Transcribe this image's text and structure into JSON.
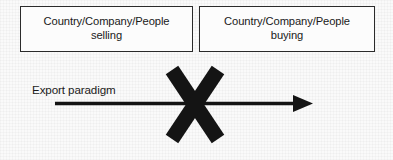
{
  "diagram": {
    "background_color": "#fafafa",
    "line_color": "#141414",
    "border_color": "#2b2b2b",
    "nodes": [
      {
        "id": "seller",
        "label": "Country/Company/People\nselling",
        "line1": "Country/Company/People",
        "line2": "selling"
      },
      {
        "id": "buyer",
        "label": "Country/Company/People\nbuying",
        "line1": "Country/Company/People",
        "line2": "buying"
      }
    ],
    "flow": {
      "label": "Export paradigm",
      "arrow_direction": "left-to-right",
      "blocked": true,
      "block_marker": "X"
    }
  }
}
